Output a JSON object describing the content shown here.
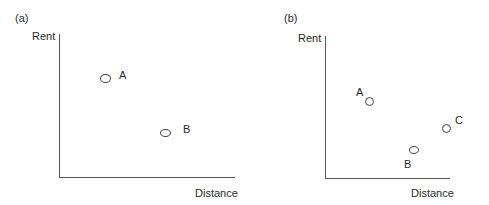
{
  "panels": [
    {
      "tag": "(a)",
      "y_label": "Rent",
      "x_label": "Distance",
      "points": [
        {
          "label": "A"
        },
        {
          "label": "B"
        }
      ]
    },
    {
      "tag": "(b)",
      "y_label": "Rent",
      "x_label": "Distance",
      "points": [
        {
          "label": "A"
        },
        {
          "label": "B"
        },
        {
          "label": "C"
        }
      ]
    }
  ]
}
